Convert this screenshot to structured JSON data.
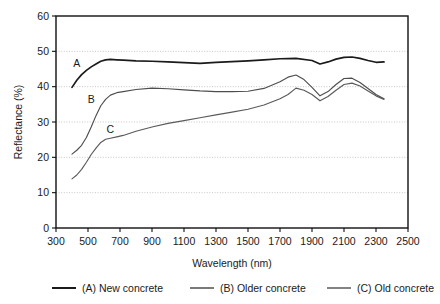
{
  "chart_data": {
    "type": "line",
    "title": "",
    "xlabel": "Wavelength (nm)",
    "ylabel": "Reflectance (%)",
    "xlim": [
      300,
      2500
    ],
    "ylim": [
      0,
      60
    ],
    "xticks": [
      300,
      500,
      700,
      900,
      1100,
      1300,
      1500,
      1700,
      1900,
      2100,
      2300,
      2500
    ],
    "yticks": [
      0,
      10,
      20,
      30,
      40,
      50,
      60
    ],
    "xtick_labels": [
      "300",
      "500",
      "700",
      "900",
      "1100",
      "1300",
      "1500",
      "1700",
      "1900",
      "2100",
      "2300",
      "2500"
    ],
    "ytick_labels": [
      "0",
      "10",
      "20",
      "30",
      "40",
      "50",
      "60"
    ],
    "grid": "horizontal-dotted",
    "legend_position": "below-axis",
    "annotations": [
      {
        "text": "A",
        "x": 430,
        "y": 45.5
      },
      {
        "text": "B",
        "x": 520,
        "y": 35.5
      },
      {
        "text": "C",
        "x": 640,
        "y": 27.0
      }
    ],
    "series": [
      {
        "name": "(A) New concrete",
        "label": "A",
        "color": "#1b1b1b",
        "x": [
          400,
          430,
          460,
          490,
          520,
          550,
          580,
          610,
          640,
          680,
          720,
          800,
          900,
          1000,
          1100,
          1200,
          1300,
          1400,
          1500,
          1600,
          1700,
          1800,
          1900,
          1950,
          2000,
          2050,
          2100,
          2150,
          2200,
          2250,
          2300,
          2350
        ],
        "y": [
          39.8,
          41.8,
          43.4,
          44.6,
          45.6,
          46.4,
          47.2,
          47.6,
          47.7,
          47.6,
          47.5,
          47.3,
          47.2,
          47.0,
          46.8,
          46.6,
          46.9,
          47.1,
          47.3,
          47.6,
          47.9,
          48.0,
          47.4,
          46.4,
          47.0,
          47.8,
          48.3,
          48.4,
          48.0,
          47.4,
          46.9,
          47.0
        ]
      },
      {
        "name": "(B) Older concrete",
        "label": "B",
        "color": "#4e4e4e",
        "x": [
          400,
          430,
          460,
          490,
          520,
          550,
          580,
          610,
          640,
          680,
          720,
          800,
          900,
          1000,
          1100,
          1200,
          1300,
          1400,
          1500,
          1600,
          1700,
          1750,
          1800,
          1850,
          1900,
          1950,
          2000,
          2050,
          2100,
          2150,
          2200,
          2250,
          2300,
          2350
        ],
        "y": [
          20.9,
          22.0,
          23.4,
          25.6,
          28.6,
          31.8,
          34.6,
          36.4,
          37.6,
          38.3,
          38.6,
          39.2,
          39.6,
          39.4,
          39.1,
          38.8,
          38.6,
          38.6,
          38.7,
          39.5,
          41.4,
          42.7,
          43.3,
          42.0,
          39.8,
          37.4,
          38.6,
          40.6,
          42.3,
          42.4,
          41.2,
          39.5,
          37.8,
          36.6
        ]
      },
      {
        "name": "(C) Old concrete",
        "label": "C",
        "color": "#5a5a5a",
        "x": [
          400,
          430,
          460,
          490,
          520,
          550,
          580,
          610,
          640,
          680,
          720,
          800,
          900,
          1000,
          1100,
          1200,
          1300,
          1400,
          1500,
          1600,
          1700,
          1750,
          1800,
          1850,
          1900,
          1950,
          2000,
          2050,
          2100,
          2150,
          2200,
          2250,
          2300,
          2350
        ],
        "y": [
          13.9,
          15.0,
          16.6,
          18.6,
          20.8,
          22.6,
          24.2,
          25.1,
          25.4,
          25.8,
          26.2,
          27.4,
          28.6,
          29.6,
          30.4,
          31.2,
          32.0,
          32.8,
          33.6,
          34.8,
          36.6,
          37.8,
          39.6,
          39.0,
          37.8,
          36.0,
          37.2,
          39.0,
          40.6,
          41.0,
          40.2,
          38.8,
          37.4,
          36.4
        ]
      }
    ]
  },
  "legend": {
    "items": [
      {
        "label": "(A) New concrete",
        "key": "a"
      },
      {
        "label": "(B) Older concrete",
        "key": "b"
      },
      {
        "label": "(C) Old concrete",
        "key": "c"
      }
    ]
  }
}
